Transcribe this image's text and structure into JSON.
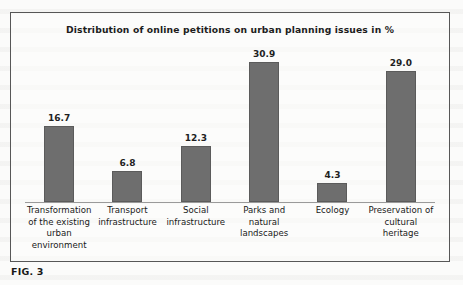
{
  "figure": {
    "caption": "FIG. 3"
  },
  "chart_data": {
    "type": "bar",
    "title": "Distribution of online petitions on urban planning issues in %",
    "xlabel": "",
    "ylabel": "",
    "ylim": [
      0,
      32
    ],
    "grid": false,
    "legend": null,
    "unit": "%",
    "categories": [
      "Transformation of the existing urban environment",
      "Transport infrastructure",
      "Social infrastructure",
      "Parks and natural landscapes",
      "Ecology",
      "Preservation of cultural heritage"
    ],
    "values": [
      16.7,
      6.8,
      12.3,
      30.9,
      4.3,
      29.0
    ],
    "value_labels": [
      "16.7",
      "6.8",
      "12.3",
      "30.9",
      "4.3",
      "29.0"
    ],
    "bar_color": "#6e6e6e",
    "bar_border_color": "#5b5b5b",
    "axis_color": "#9a9a9a",
    "frame_color": "#575757",
    "text_color": "#1d1d1d"
  }
}
